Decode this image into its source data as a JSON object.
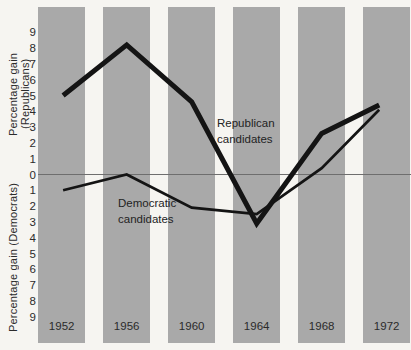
{
  "colors": {
    "background": "#f6f5f1",
    "bar": "#a9a9a9",
    "line": "#141414",
    "zero_line": "#6e6e6e",
    "text": "#2b2b2b"
  },
  "chart_data": {
    "type": "line",
    "categories": [
      "1952",
      "1956",
      "1960",
      "1964",
      "1968",
      "1972"
    ],
    "series": [
      {
        "name": "Republican candidates",
        "slug": "republican-line",
        "style": "thick",
        "values": [
          5.0,
          8.2,
          4.6,
          -3.1,
          2.6,
          4.4
        ]
      },
      {
        "name": "Democratic candidates",
        "slug": "democratic-line",
        "style": "thin",
        "values": [
          -1.0,
          0.0,
          -2.1,
          -2.5,
          0.4,
          4.1
        ]
      }
    ],
    "series_labels": {
      "republican": "Republican\ncandidates",
      "democratic": "Democratic\ncandidates"
    },
    "ylabel_top": "Percentage gain (Republicans)",
    "ylabel_bottom": "Percentage gain (Democrats)",
    "yticks": [
      {
        "label": "9",
        "value": 9
      },
      {
        "label": "8",
        "value": 8
      },
      {
        "label": "7",
        "value": 7
      },
      {
        "label": "6",
        "value": 6
      },
      {
        "label": "5",
        "value": 5
      },
      {
        "label": "4",
        "value": 4
      },
      {
        "label": "3",
        "value": 3
      },
      {
        "label": "2",
        "value": 2
      },
      {
        "label": "1",
        "value": 1
      },
      {
        "label": "0",
        "value": 0
      },
      {
        "label": "1",
        "value": -1
      },
      {
        "label": "2",
        "value": -2
      },
      {
        "label": "3",
        "value": -3
      },
      {
        "label": "4",
        "value": -4
      },
      {
        "label": "5",
        "value": -5
      },
      {
        "label": "6",
        "value": -6
      },
      {
        "label": "7",
        "value": -7
      },
      {
        "label": "8",
        "value": -8
      },
      {
        "label": "9",
        "value": -9
      }
    ],
    "ylim": [
      -9.5,
      9.5
    ],
    "xlabel": "",
    "baseline": 0,
    "grid": false,
    "legend": "none (inline text labels on plot)"
  }
}
